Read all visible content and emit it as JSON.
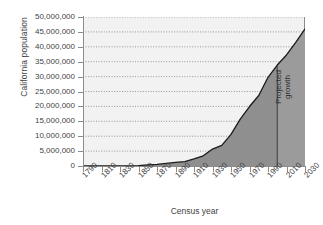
{
  "chart_data": {
    "type": "area",
    "title": "",
    "xlabel": "Census year",
    "ylabel": "California population",
    "xlim": [
      1790,
      2030
    ],
    "ylim": [
      0,
      50000000
    ],
    "grid": true,
    "legend": false,
    "xticklabels": [
      "1790",
      "1810",
      "1830",
      "1850",
      "1870",
      "1890",
      "1910",
      "1930",
      "1950",
      "1970",
      "1990",
      "2010",
      "2030"
    ],
    "xtickvalues": [
      1790,
      1810,
      1830,
      1850,
      1870,
      1890,
      1910,
      1930,
      1950,
      1970,
      1990,
      2010,
      2030
    ],
    "yticklabels": [
      "0",
      "5,000,000",
      "10,000,000",
      "15,000,000",
      "20,000,000",
      "25,000,000",
      "30,000,000",
      "35,000,000",
      "40,000,000",
      "45,000,000",
      "50,000,000"
    ],
    "ytickvalues": [
      0,
      5000000,
      10000000,
      15000000,
      20000000,
      25000000,
      30000000,
      35000000,
      40000000,
      45000000,
      50000000
    ],
    "x": [
      1790,
      1810,
      1830,
      1850,
      1860,
      1870,
      1880,
      1890,
      1900,
      1910,
      1920,
      1930,
      1940,
      1950,
      1960,
      1970,
      1980,
      1990,
      2000,
      2010,
      2020,
      2030
    ],
    "values": [
      0,
      0,
      0,
      93000,
      380000,
      560000,
      865000,
      1213000,
      1485000,
      2378000,
      3427000,
      5677000,
      6907000,
      10586000,
      15717000,
      19953000,
      23668000,
      29760000,
      33872000,
      37254000,
      41500000,
      46000000
    ],
    "series": [
      {
        "name": "California population",
        "values": [
          0,
          0,
          0,
          93000,
          380000,
          560000,
          865000,
          1213000,
          1485000,
          2378000,
          3427000,
          5677000,
          6907000,
          10586000,
          15717000,
          19953000,
          23668000,
          29760000,
          33872000,
          37254000,
          41500000,
          46000000
        ]
      }
    ],
    "annotations": [
      {
        "name": "projected-growth",
        "text_line1": "Projected",
        "text_line2": "growth",
        "divider_year": 2000,
        "orientation": "vertical"
      }
    ],
    "colors": {
      "area_fill": "#8f8f8f",
      "projected_fill": "#9b9b9b",
      "line": "#1a1a1a",
      "grid": "#8a8a8a",
      "plot_background": "#f2f2f2",
      "axis": "#8c8c8c",
      "text": "#3f3f3f"
    }
  }
}
